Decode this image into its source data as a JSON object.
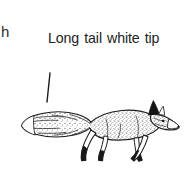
{
  "figure": {
    "width": 184,
    "height": 172,
    "background_color": "#ffffff",
    "ink_color": "#1a1a1a",
    "text_color": "#222222"
  },
  "edge_fragment": {
    "text": "h"
  },
  "callout": {
    "label": "Long tail white tip",
    "line_1": "Long tail white",
    "line_2": "tip"
  },
  "leader_line": {
    "x1": 10,
    "y1": 5,
    "x2": 7,
    "y2": 34,
    "color": "#1a1a1a"
  },
  "subject": {
    "name": "red fox",
    "pose": "walking in profile, facing right",
    "parts": [
      "bushy-tail",
      "white-tail-tip",
      "stippled-body",
      "dark-ear",
      "pointed-muzzle",
      "eye",
      "foreleg-front",
      "foreleg-back",
      "hindleg-front",
      "hindleg-back",
      "dark-lower-legs"
    ]
  }
}
